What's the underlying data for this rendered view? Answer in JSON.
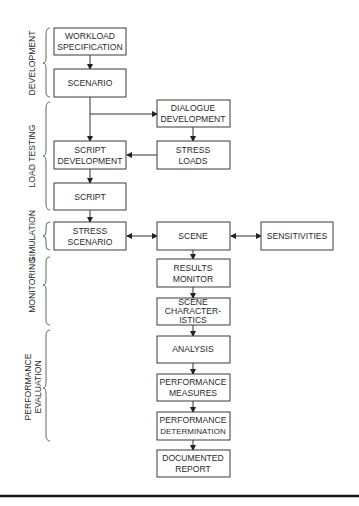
{
  "diagram": {
    "phases": [
      {
        "id": "development",
        "label": "DEVELOPMENT"
      },
      {
        "id": "load-testing",
        "label": "LOAD TESTING"
      },
      {
        "id": "simulation",
        "label": "SIMULATION"
      },
      {
        "id": "monitoring",
        "label": "MONITORING"
      },
      {
        "id": "performance-evaluation",
        "label_line1": "PERFORMANCE",
        "label_line2": "EVALUATION"
      }
    ],
    "nodes": {
      "workload_spec": [
        "WORKLOAD",
        "SPECIFICATION"
      ],
      "scenario": [
        "SCENARIO"
      ],
      "dialogue_dev": [
        "DIALOGUE",
        "DEVELOPMENT"
      ],
      "stress_loads": [
        "STRESS",
        "LOADS"
      ],
      "script_dev": [
        "SCRIPT",
        "DEVELOPMENT"
      ],
      "script": [
        "SCRIPT"
      ],
      "stress_scenario": [
        "STRESS",
        "SCENARIO"
      ],
      "scene": [
        "SCENE"
      ],
      "sensitivities": [
        "SENSITIVITIES"
      ],
      "results_monitor": [
        "RESULTS",
        "MONITOR"
      ],
      "scene_characteristics": [
        "SCENE",
        "CHARACTER-",
        "ISTICS"
      ],
      "analysis": [
        "ANALYSIS"
      ],
      "performance_measures": [
        "PERFORMANCE",
        "MEASURES"
      ],
      "performance_determination": [
        "PERFORMANCE",
        "DETERMINATION"
      ],
      "documented_report": [
        "DOCUMENTED",
        "REPORT"
      ]
    },
    "edges": [
      {
        "from": "workload_spec",
        "to": "scenario",
        "type": "directed"
      },
      {
        "from": "scenario",
        "to": "script_dev",
        "type": "directed"
      },
      {
        "from": "scenario",
        "to": "dialogue_dev",
        "type": "directed"
      },
      {
        "from": "dialogue_dev",
        "to": "stress_loads",
        "type": "directed"
      },
      {
        "from": "stress_loads",
        "to": "script_dev",
        "type": "directed"
      },
      {
        "from": "script_dev",
        "to": "script",
        "type": "directed"
      },
      {
        "from": "script",
        "to": "stress_scenario",
        "type": "directed"
      },
      {
        "from": "stress_scenario",
        "to": "scene",
        "type": "bidirectional"
      },
      {
        "from": "scene",
        "to": "sensitivities",
        "type": "bidirectional"
      },
      {
        "from": "scene",
        "to": "results_monitor",
        "type": "directed"
      },
      {
        "from": "results_monitor",
        "to": "scene_characteristics",
        "type": "directed"
      },
      {
        "from": "scene_characteristics",
        "to": "analysis",
        "type": "directed"
      },
      {
        "from": "analysis",
        "to": "performance_measures",
        "type": "directed"
      },
      {
        "from": "performance_measures",
        "to": "performance_determination",
        "type": "directed"
      },
      {
        "from": "performance_determination",
        "to": "documented_report",
        "type": "directed"
      }
    ]
  }
}
